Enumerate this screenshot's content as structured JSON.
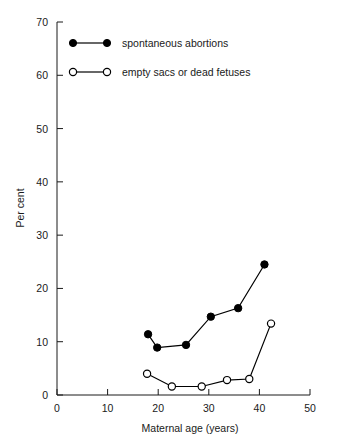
{
  "chart_data": {
    "type": "line",
    "title": "",
    "xlabel": "Maternal age (years)",
    "ylabel": "Per cent",
    "xlim": [
      0,
      50
    ],
    "ylim": [
      0,
      70
    ],
    "xticks": [
      0,
      10,
      20,
      30,
      40,
      50
    ],
    "yticks": [
      0,
      10,
      20,
      30,
      40,
      50,
      60,
      70
    ],
    "grid": false,
    "legend_position": "top-left-inside",
    "series": [
      {
        "name": "spontaneous abortions",
        "marker": "filled-circle",
        "x": [
          18.0,
          19.8,
          25.5,
          30.4,
          35.8,
          41.0
        ],
        "y": [
          11.4,
          8.9,
          9.4,
          14.7,
          16.3,
          24.5
        ]
      },
      {
        "name": "empty sacs or dead fetuses",
        "marker": "open-circle",
        "x": [
          17.8,
          22.7,
          28.6,
          33.6,
          38.0,
          42.3
        ],
        "y": [
          4.0,
          1.6,
          1.6,
          2.8,
          3.0,
          13.4
        ]
      }
    ]
  },
  "axes": {
    "x_title": "Maternal age (years)",
    "y_title": "Per cent",
    "x_tick_labels": [
      "0",
      "10",
      "20",
      "30",
      "40",
      "50"
    ],
    "y_tick_labels": [
      "0",
      "10",
      "20",
      "30",
      "40",
      "50",
      "60",
      "70"
    ]
  },
  "legend": {
    "items": [
      {
        "label": "spontaneous abortions",
        "marker": "filled-circle"
      },
      {
        "label": "empty sacs or dead fetuses",
        "marker": "open-circle"
      }
    ]
  },
  "colors": {
    "ink": "#1a1a1a",
    "series": "#000000",
    "background": "#ffffff"
  }
}
